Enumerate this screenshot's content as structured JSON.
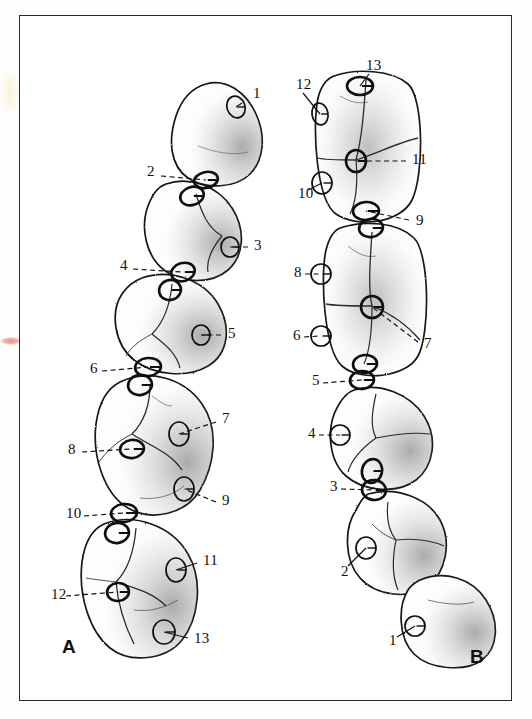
{
  "figure": {
    "panels": [
      {
        "id": "A",
        "letter": "A",
        "x": 62,
        "y": 637
      },
      {
        "id": "B",
        "letter": "B",
        "x": 470,
        "y": 647
      }
    ],
    "frame": {
      "x": 19,
      "y": 15,
      "width": 493,
      "height": 686,
      "stroke": "#2a2a2a"
    },
    "colors": {
      "ink": "#1a1a1a",
      "paper": "#ffffff",
      "page": "#fdfdfb",
      "stipple": "#3a3a3a",
      "blotch_pink": "#e8918c",
      "blotch_yellow": "#f6f3ce"
    }
  },
  "callouts_a": [
    {
      "n": "1",
      "lx": 253,
      "ly": 94,
      "anchor_x": 242,
      "anchor_y": 103,
      "marker_x": 236,
      "marker_y": 107,
      "style": "solid"
    },
    {
      "n": "2",
      "lx": 147,
      "ly": 172,
      "anchor_x": 161,
      "anchor_y": 176,
      "marker_x": 206,
      "marker_y": 180,
      "style": "dashed"
    },
    {
      "n": "3",
      "lx": 254,
      "ly": 246,
      "anchor_x": 248,
      "anchor_y": 247,
      "marker_x": 230,
      "marker_y": 247,
      "style": "dashed"
    },
    {
      "n": "4",
      "lx": 120,
      "ly": 266,
      "anchor_x": 133,
      "anchor_y": 269,
      "marker_x": 183,
      "marker_y": 272,
      "style": "dashed"
    },
    {
      "n": "5",
      "lx": 228,
      "ly": 334,
      "anchor_x": 221,
      "anchor_y": 335,
      "marker_x": 201,
      "marker_y": 335,
      "style": "dashed"
    },
    {
      "n": "6",
      "lx": 90,
      "ly": 369,
      "anchor_x": 102,
      "anchor_y": 371,
      "marker_x": 148,
      "marker_y": 367,
      "style": "dashed"
    },
    {
      "n": "7",
      "lx": 222,
      "ly": 419,
      "anchor_x": 216,
      "anchor_y": 422,
      "marker_x": 179,
      "marker_y": 434,
      "style": "dashed"
    },
    {
      "n": "8",
      "lx": 68,
      "ly": 450,
      "anchor_x": 82,
      "anchor_y": 452,
      "marker_x": 132,
      "marker_y": 449,
      "style": "dashed"
    },
    {
      "n": "9",
      "lx": 222,
      "ly": 501,
      "anchor_x": 216,
      "anchor_y": 502,
      "marker_x": 184,
      "marker_y": 489,
      "style": "dashed"
    },
    {
      "n": "10",
      "lx": 66,
      "ly": 514,
      "anchor_x": 84,
      "anchor_y": 516,
      "marker_x": 124,
      "marker_y": 513,
      "style": "dashed"
    },
    {
      "n": "11",
      "lx": 203,
      "ly": 561,
      "anchor_x": 197,
      "anchor_y": 563,
      "marker_x": 176,
      "marker_y": 570,
      "style": "solid"
    },
    {
      "n": "12",
      "lx": 51,
      "ly": 595,
      "anchor_x": 66,
      "anchor_y": 596,
      "marker_x": 118,
      "marker_y": 592,
      "style": "dashed"
    },
    {
      "n": "13",
      "lx": 194,
      "ly": 639,
      "anchor_x": 188,
      "anchor_y": 638,
      "marker_x": 164,
      "marker_y": 632,
      "style": "solid"
    }
  ],
  "callouts_b": [
    {
      "n": "13",
      "lx": 366,
      "ly": 66,
      "anchor_x": 369,
      "anchor_y": 74,
      "marker_x": 360,
      "marker_y": 86,
      "style": "solid"
    },
    {
      "n": "12",
      "lx": 296,
      "ly": 85,
      "anchor_x": 303,
      "anchor_y": 93,
      "marker_x": 320,
      "marker_y": 114,
      "style": "solid"
    },
    {
      "n": "11",
      "lx": 412,
      "ly": 160,
      "anchor_x": 406,
      "anchor_y": 161,
      "marker_x": 356,
      "marker_y": 161,
      "style": "dashed"
    },
    {
      "n": "10",
      "lx": 298,
      "ly": 194,
      "anchor_x": 308,
      "anchor_y": 190,
      "marker_x": 322,
      "marker_y": 183,
      "style": "solid"
    },
    {
      "n": "9",
      "lx": 416,
      "ly": 221,
      "anchor_x": 409,
      "anchor_y": 220,
      "marker_x": 366,
      "marker_y": 211,
      "style": "dashed"
    },
    {
      "n": "8",
      "lx": 294,
      "ly": 273,
      "anchor_x": 305,
      "anchor_y": 274,
      "marker_x": 321,
      "marker_y": 274,
      "style": "dashed"
    },
    {
      "n": "7",
      "lx": 424,
      "ly": 344,
      "anchor_x": 418,
      "anchor_y": 342,
      "marker_x": 372,
      "marker_y": 307,
      "style": "dashed"
    },
    {
      "n": "6",
      "lx": 293,
      "ly": 336,
      "anchor_x": 304,
      "anchor_y": 337,
      "marker_x": 321,
      "marker_y": 336,
      "style": "dashed"
    },
    {
      "n": "5",
      "lx": 312,
      "ly": 381,
      "anchor_x": 323,
      "anchor_y": 383,
      "marker_x": 362,
      "marker_y": 380,
      "style": "dashed"
    },
    {
      "n": "4",
      "lx": 308,
      "ly": 434,
      "anchor_x": 319,
      "anchor_y": 435,
      "marker_x": 340,
      "marker_y": 435,
      "style": "dashed"
    },
    {
      "n": "3",
      "lx": 330,
      "ly": 487,
      "anchor_x": 341,
      "anchor_y": 489,
      "marker_x": 374,
      "marker_y": 490,
      "style": "dashed"
    },
    {
      "n": "2",
      "lx": 341,
      "ly": 572,
      "anchor_x": 348,
      "anchor_y": 566,
      "marker_x": 366,
      "marker_y": 548,
      "style": "solid"
    },
    {
      "n": "1",
      "lx": 389,
      "ly": 641,
      "anchor_x": 397,
      "anchor_y": 637,
      "marker_x": 415,
      "marker_y": 626,
      "style": "solid"
    }
  ],
  "teeth_a": [
    {
      "id": "a1",
      "cx": 218,
      "cy": 130,
      "rx": 46,
      "ry": 48,
      "rot": -14,
      "shape": "premolar-tri"
    },
    {
      "id": "a2",
      "cx": 190,
      "cy": 226,
      "rx": 50,
      "ry": 48,
      "rot": -6,
      "shape": "premolar-round"
    },
    {
      "id": "a3",
      "cx": 168,
      "cy": 320,
      "rx": 55,
      "ry": 50,
      "rot": -4,
      "shape": "molar-round"
    },
    {
      "id": "a4",
      "cx": 150,
      "cy": 440,
      "rx": 60,
      "ry": 70,
      "rot": 4,
      "shape": "molar-long"
    },
    {
      "id": "a5",
      "cx": 133,
      "cy": 585,
      "rx": 62,
      "ry": 70,
      "rot": 4,
      "shape": "molar-long"
    }
  ],
  "teeth_b": [
    {
      "id": "b1",
      "cx": 368,
      "cy": 147,
      "rx": 54,
      "ry": 76,
      "rot": 0,
      "shape": "molar-rect"
    },
    {
      "id": "b2",
      "cx": 374,
      "cy": 300,
      "rx": 54,
      "ry": 78,
      "rot": 0,
      "shape": "molar-rect"
    },
    {
      "id": "b3",
      "cx": 383,
      "cy": 441,
      "rx": 48,
      "ry": 52,
      "rot": 6,
      "shape": "premolar-round"
    },
    {
      "id": "b4",
      "cx": 396,
      "cy": 540,
      "rx": 50,
      "ry": 50,
      "rot": 10,
      "shape": "premolar-round"
    },
    {
      "id": "b5",
      "cx": 449,
      "cy": 617,
      "rx": 47,
      "ry": 46,
      "rot": 16,
      "shape": "premolar-tri"
    }
  ],
  "contact_markers_a": [
    {
      "cx": 236,
      "cy": 107,
      "rx": 9,
      "ry": 11,
      "rot": -20,
      "weight": "thin"
    },
    {
      "cx": 206,
      "cy": 180,
      "rx": 12,
      "ry": 8,
      "rot": -12,
      "weight": "bold"
    },
    {
      "cx": 192,
      "cy": 196,
      "rx": 12,
      "ry": 9,
      "rot": -18,
      "weight": "bold"
    },
    {
      "cx": 230,
      "cy": 247,
      "rx": 9,
      "ry": 10,
      "rot": 0,
      "weight": "thin"
    },
    {
      "cx": 183,
      "cy": 272,
      "rx": 12,
      "ry": 9,
      "rot": -16,
      "weight": "bold"
    },
    {
      "cx": 170,
      "cy": 290,
      "rx": 11,
      "ry": 10,
      "rot": -16,
      "weight": "bold"
    },
    {
      "cx": 201,
      "cy": 335,
      "rx": 9,
      "ry": 10,
      "rot": 0,
      "weight": "thin"
    },
    {
      "cx": 148,
      "cy": 367,
      "rx": 13,
      "ry": 9,
      "rot": -6,
      "weight": "bold"
    },
    {
      "cx": 140,
      "cy": 385,
      "rx": 12,
      "ry": 10,
      "rot": -10,
      "weight": "bold"
    },
    {
      "cx": 179,
      "cy": 434,
      "rx": 10,
      "ry": 12,
      "rot": 0,
      "weight": "thin"
    },
    {
      "cx": 132,
      "cy": 449,
      "rx": 12,
      "ry": 9,
      "rot": -8,
      "weight": "bold"
    },
    {
      "cx": 184,
      "cy": 489,
      "rx": 10,
      "ry": 12,
      "rot": 0,
      "weight": "thin"
    },
    {
      "cx": 124,
      "cy": 513,
      "rx": 13,
      "ry": 9,
      "rot": -6,
      "weight": "bold"
    },
    {
      "cx": 117,
      "cy": 533,
      "rx": 12,
      "ry": 10,
      "rot": -10,
      "weight": "bold"
    },
    {
      "cx": 176,
      "cy": 570,
      "rx": 10,
      "ry": 12,
      "rot": 0,
      "weight": "thin"
    },
    {
      "cx": 118,
      "cy": 592,
      "rx": 11,
      "ry": 9,
      "rot": -6,
      "weight": "bold"
    },
    {
      "cx": 164,
      "cy": 632,
      "rx": 11,
      "ry": 12,
      "rot": 0,
      "weight": "thin"
    }
  ],
  "contact_markers_b": [
    {
      "cx": 360,
      "cy": 86,
      "rx": 13,
      "ry": 9,
      "rot": 0,
      "weight": "bold"
    },
    {
      "cx": 320,
      "cy": 114,
      "rx": 8,
      "ry": 11,
      "rot": -10,
      "weight": "thin"
    },
    {
      "cx": 356,
      "cy": 161,
      "rx": 10,
      "ry": 11,
      "rot": 0,
      "weight": "bold"
    },
    {
      "cx": 322,
      "cy": 183,
      "rx": 10,
      "ry": 11,
      "rot": 0,
      "weight": "thin"
    },
    {
      "cx": 366,
      "cy": 211,
      "rx": 13,
      "ry": 9,
      "rot": -4,
      "weight": "bold"
    },
    {
      "cx": 371,
      "cy": 228,
      "rx": 12,
      "ry": 9,
      "rot": -8,
      "weight": "bold"
    },
    {
      "cx": 321,
      "cy": 274,
      "rx": 10,
      "ry": 10,
      "rot": 0,
      "weight": "thin"
    },
    {
      "cx": 372,
      "cy": 307,
      "rx": 11,
      "ry": 11,
      "rot": 0,
      "weight": "bold"
    },
    {
      "cx": 321,
      "cy": 336,
      "rx": 10,
      "ry": 10,
      "rot": 0,
      "weight": "thin"
    },
    {
      "cx": 365,
      "cy": 364,
      "rx": 12,
      "ry": 9,
      "rot": -6,
      "weight": "bold"
    },
    {
      "cx": 362,
      "cy": 380,
      "rx": 12,
      "ry": 9,
      "rot": -6,
      "weight": "bold"
    },
    {
      "cx": 340,
      "cy": 435,
      "rx": 10,
      "ry": 10,
      "rot": 0,
      "weight": "thin"
    },
    {
      "cx": 372,
      "cy": 471,
      "rx": 10,
      "ry": 12,
      "rot": 14,
      "weight": "bold"
    },
    {
      "cx": 374,
      "cy": 490,
      "rx": 12,
      "ry": 10,
      "rot": 8,
      "weight": "bold"
    },
    {
      "cx": 366,
      "cy": 548,
      "rx": 10,
      "ry": 11,
      "rot": 0,
      "weight": "thin"
    },
    {
      "cx": 415,
      "cy": 626,
      "rx": 10,
      "ry": 10,
      "rot": 0,
      "weight": "thin"
    }
  ]
}
